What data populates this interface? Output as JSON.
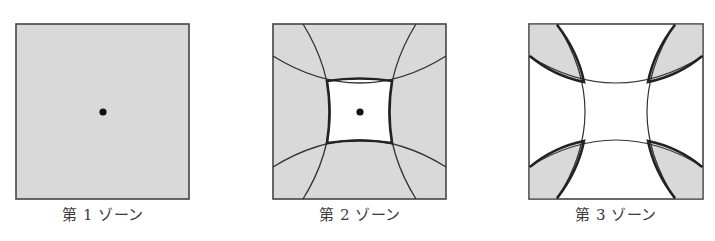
{
  "figure": {
    "colors": {
      "shade": "#d9d9d9",
      "line": "#333333",
      "white": "#ffffff"
    },
    "panels": [
      {
        "id": "zone1",
        "label": "第 1 ゾーン",
        "has_center_dot": true,
        "shaded_region": "entire-square"
      },
      {
        "id": "zone2",
        "label": "第 2 ゾーン",
        "has_center_dot": true,
        "shaded_region": "all-except-center-curved-square"
      },
      {
        "id": "zone3",
        "label": "第 3 ゾーン",
        "has_center_dot": false,
        "shaded_region": "four-corner-lenses"
      }
    ]
  }
}
